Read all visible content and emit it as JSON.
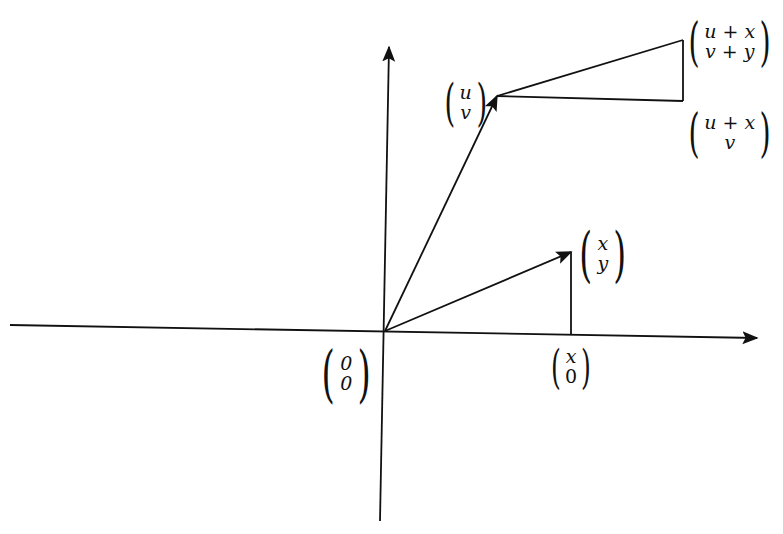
{
  "diagram": {
    "colors": {
      "stroke": "#111111",
      "background": "#ffffff"
    },
    "axes": {
      "x_axis": {
        "from": [
          10,
          325
        ],
        "to": [
          757,
          338
        ]
      },
      "y_axis": {
        "from": [
          380,
          521
        ],
        "to": [
          389,
          47
        ]
      }
    },
    "points": {
      "origin": [
        385,
        331
      ],
      "uv": [
        497,
        96
      ],
      "uv_sum": [
        683,
        40
      ],
      "u_plus_x_v": [
        683,
        101
      ],
      "xy": [
        571,
        252
      ],
      "x0": [
        571,
        334
      ]
    },
    "labels": {
      "origin": {
        "top": "0",
        "bottom": "0"
      },
      "uv": {
        "top": "u",
        "bottom": "v"
      },
      "sum": {
        "top": "u + x",
        "bottom": "v + y"
      },
      "u_plus_x_v": {
        "top": "u + x",
        "bottom": "v"
      },
      "xy": {
        "top": "x",
        "bottom": "y"
      },
      "x0": {
        "top": "x",
        "bottom": "0"
      }
    }
  }
}
